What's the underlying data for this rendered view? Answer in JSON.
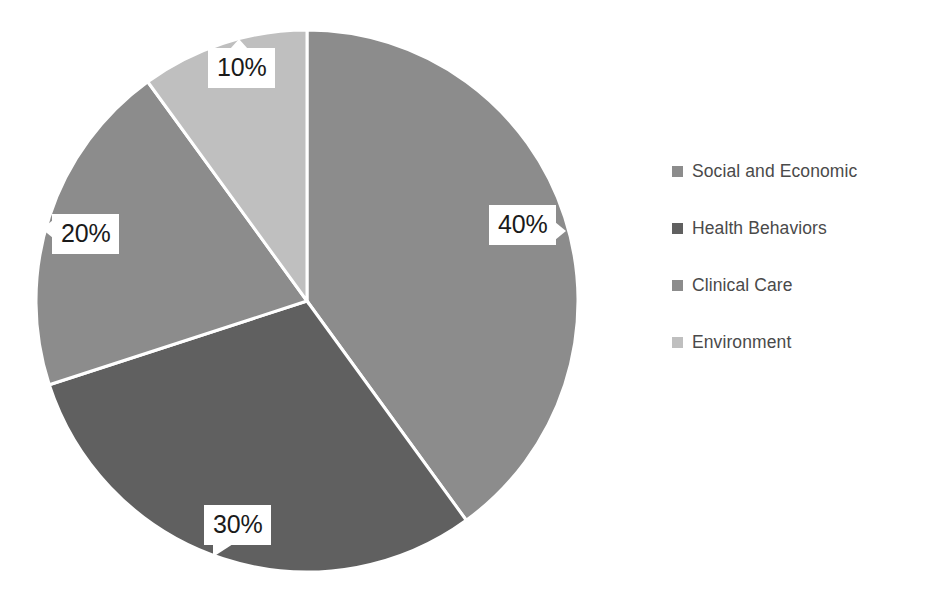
{
  "chart_data": {
    "type": "pie",
    "title": "",
    "subtitle": "",
    "xlabel": "",
    "ylabel": "",
    "categories": [
      "Social and Economic",
      "Health Behaviors",
      "Clinical Care",
      "Environment"
    ],
    "values": [
      40,
      30,
      20,
      10
    ],
    "value_unit": "%",
    "data_labels": [
      "40%",
      "30%",
      "20%",
      "10%"
    ],
    "colors": [
      "#8c8c8c",
      "#606060",
      "#8c8c8c",
      "#bfbfbf"
    ],
    "slice_border_color": "#ffffff",
    "start_angle_deg": 0,
    "direction": "clockwise",
    "grid": false,
    "legend_position": "right",
    "background": "#ffffff",
    "label_text_color": "#1a1a1a",
    "legend_text_color": "#4a4a4a",
    "slices": [
      {
        "label": "Social and Economic",
        "value": 40,
        "data_label": "40%",
        "color": "#8c8c8c"
      },
      {
        "label": "Health Behaviors",
        "value": 30,
        "data_label": "30%",
        "color": "#606060"
      },
      {
        "label": "Clinical Care",
        "value": 20,
        "data_label": "20%",
        "color": "#8c8c8c"
      },
      {
        "label": "Environment",
        "value": 10,
        "data_label": "10%",
        "color": "#bfbfbf"
      }
    ]
  },
  "legend": {
    "items": [
      {
        "label": "Social and Economic",
        "color": "#8c8c8c"
      },
      {
        "label": "Health Behaviors",
        "color": "#606060"
      },
      {
        "label": "Clinical Care",
        "color": "#8c8c8c"
      },
      {
        "label": "Environment",
        "color": "#bfbfbf"
      }
    ]
  },
  "labels": {
    "slice_40": "40%",
    "slice_30": "30%",
    "slice_20": "20%",
    "slice_10": "10%"
  }
}
